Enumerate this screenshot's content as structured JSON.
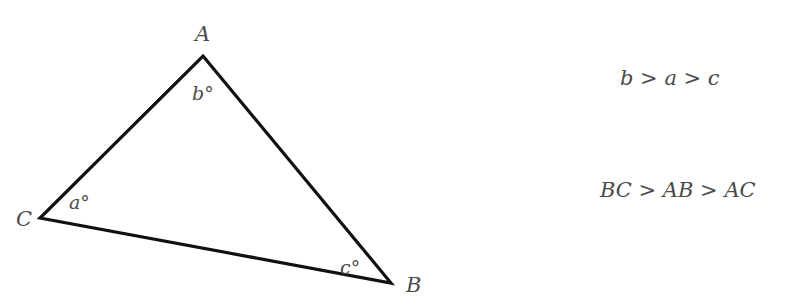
{
  "diagram": {
    "type": "triangle",
    "vertices": [
      {
        "name": "A",
        "label": "A",
        "x": 203,
        "y": 56
      },
      {
        "name": "B",
        "label": "B",
        "x": 391,
        "y": 283
      },
      {
        "name": "C",
        "label": "C",
        "x": 40,
        "y": 218
      }
    ],
    "angles": [
      {
        "vertex": "A",
        "label": "b°"
      },
      {
        "vertex": "C",
        "label": "a°"
      },
      {
        "vertex": "B",
        "label": "c°"
      }
    ],
    "stroke_color": "#111111"
  },
  "relations": {
    "angles": "b > a > c",
    "sides": "BC > AB > AC"
  }
}
